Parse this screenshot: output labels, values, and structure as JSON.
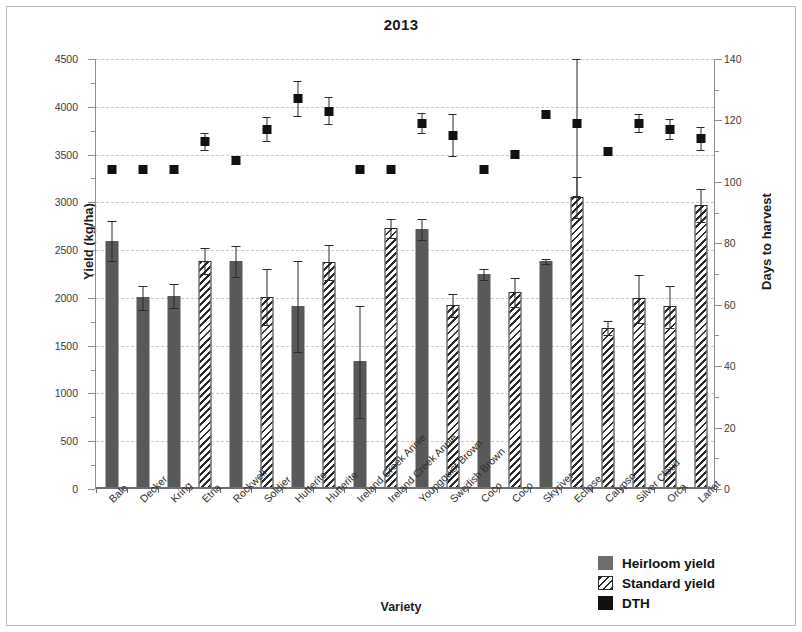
{
  "title": "2013",
  "axes": {
    "y_left_label": "Yield (kg/ha)",
    "y_right_label": "Days to harvest",
    "x_label": "Variety",
    "y_left_ticks": [
      "0",
      "500",
      "1000",
      "1500",
      "2000",
      "2500",
      "3000",
      "3500",
      "4000",
      "4500"
    ],
    "y_right_ticks": [
      "0",
      "20",
      "40",
      "60",
      "80",
      "100",
      "120",
      "140"
    ]
  },
  "legend": {
    "items": [
      {
        "label": "Heirloom yield",
        "swatch": "solid-gray-square",
        "color": "#6e6e6e"
      },
      {
        "label": "Standard yield",
        "swatch": "diagonal-hatch-square",
        "color": "#2b2b2b"
      },
      {
        "label": "DTH",
        "swatch": "black-square",
        "color": "#111111"
      }
    ]
  },
  "chart_data": {
    "type": "bar",
    "title": "2013",
    "xlabel": "Variety",
    "ylabel": "Yield (kg/ha)",
    "ylabel_secondary": "Days to harvest",
    "ylim": [
      0,
      4500
    ],
    "ylim_secondary": [
      0,
      140
    ],
    "grid": true,
    "legend_position": "bottom-right",
    "categories": [
      "Bale",
      "Decker",
      "Kring",
      "Etna",
      "Rockwell",
      "Soldier",
      "Hutterite",
      "Hutterite",
      "Ireland Creek Annie",
      "Ireland Creek Annie",
      "Youngquist Brown",
      "Swedish Brown",
      "Coco",
      "Coco",
      "Skyriver",
      "Eclipse",
      "Calypso",
      "Silver Cloud",
      "Orca",
      "Lariat"
    ],
    "bar_types": [
      "heirloom",
      "heirloom",
      "heirloom",
      "standard",
      "heirloom",
      "standard",
      "heirloom",
      "standard",
      "heirloom",
      "standard",
      "heirloom",
      "standard",
      "heirloom",
      "standard",
      "heirloom",
      "standard",
      "standard",
      "standard",
      "standard",
      "standard"
    ],
    "series": [
      {
        "name": "Heirloom yield",
        "axis": "left",
        "values": [
          2590,
          1995,
          2015,
          null,
          2375,
          null,
          1905,
          null,
          1325,
          null,
          2710,
          null,
          2240,
          null,
          2375,
          null,
          null,
          null,
          null,
          null
        ],
        "errors": [
          215,
          130,
          130,
          null,
          165,
          null,
          480,
          null,
          590,
          null,
          115,
          null,
          60,
          null,
          35,
          null,
          null,
          null,
          null,
          null
        ]
      },
      {
        "name": "Standard yield",
        "axis": "left",
        "values": [
          null,
          null,
          null,
          2380,
          null,
          2000,
          null,
          2365,
          null,
          2725,
          null,
          1915,
          null,
          2050,
          null,
          3050,
          1680,
          1985,
          1905,
          2960
        ],
        "errors": [
          null,
          null,
          null,
          140,
          null,
          300,
          null,
          185,
          null,
          105,
          null,
          125,
          null,
          155,
          null,
          220,
          80,
          255,
          225,
          180
        ]
      },
      {
        "name": "DTH",
        "axis": "right",
        "values": [
          104,
          104,
          104,
          113,
          107,
          117,
          127,
          123,
          104,
          104,
          119,
          115,
          104,
          109,
          122,
          119,
          110,
          119,
          117,
          114
        ],
        "errors": [
          0,
          0,
          0,
          3,
          1.5,
          4,
          6,
          4.5,
          0,
          0,
          3.5,
          7,
          0,
          1,
          1,
          24,
          0,
          3,
          3.5,
          4
        ]
      }
    ]
  }
}
